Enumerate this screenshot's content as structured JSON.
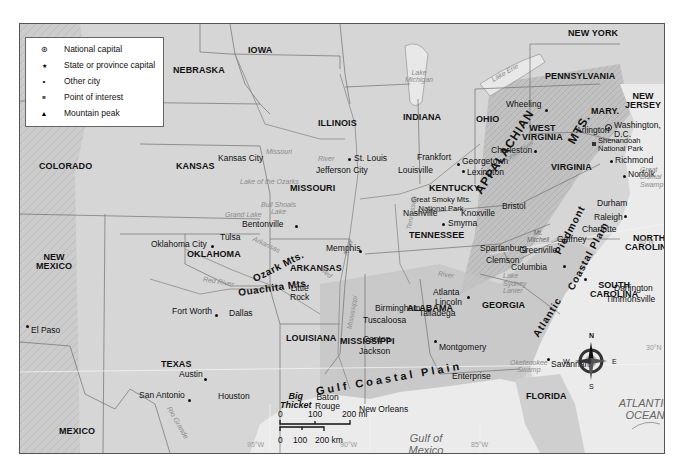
{
  "legend": {
    "items": [
      {
        "symbol": "national-capital-icon",
        "glyph": "⊛",
        "label": "National capital"
      },
      {
        "symbol": "state-capital-icon",
        "glyph": "★",
        "label": "State or province capital"
      },
      {
        "symbol": "city-icon",
        "glyph": "•",
        "label": "Other city"
      },
      {
        "symbol": "point-of-interest-icon",
        "glyph": "■",
        "label": "Point of interest"
      },
      {
        "symbol": "mountain-peak-icon",
        "glyph": "▲",
        "label": "Mountain peak"
      }
    ]
  },
  "states": {
    "nebraska": "NEBRASKA",
    "iowa": "IOWA",
    "illinois": "ILLINOIS",
    "indiana": "INDIANA",
    "ohio": "OHIO",
    "pennsylvania": "PENNSYLVANIA",
    "new_york": "NEW YORK",
    "new_jersey": "NEW\nJERSEY",
    "maryland": "MARY.",
    "west_virginia": "WEST\nVIRGINIA",
    "virginia": "VIRGINIA",
    "kentucky": "KENTUCKY",
    "tennessee": "TENNESSEE",
    "north_carolina": "NORTH\nCAROLINA",
    "south_carolina": "SOUTH\nCAROLINA",
    "georgia": "GEORGIA",
    "alabama": "ALABAMA",
    "mississippi": "MISSISSIPPI",
    "louisiana": "LOUISIANA",
    "arkansas": "ARKANSAS",
    "missouri": "MISSOURI",
    "kansas": "KANSAS",
    "colorado": "COLORADO",
    "oklahoma": "OKLAHOMA",
    "new_mexico": "NEW\nMEXICO",
    "texas": "TEXAS",
    "florida": "FLORIDA",
    "mexico": "MEXICO"
  },
  "cities": {
    "washington": "Washington,\nD.C.",
    "arlington": "Arlington",
    "richmond": "Richmond",
    "norfolk": "Norfolk",
    "wheeling": "Wheeling",
    "charleston": "Charleston",
    "frankfort": "Frankfort",
    "georgetown": "Georgetown",
    "lexington": "Lexington",
    "louisville": "Louisville",
    "bristol": "Bristol",
    "nashville": "Nashville",
    "knoxville": "Knoxville",
    "smyrna": "Smyrna",
    "durham": "Durham",
    "raleigh": "Raleigh",
    "charlotte": "Charlotte",
    "gaffney": "Gaffney",
    "spartanburg": "Spartanburg",
    "greenville": "Greenville",
    "clemson": "Clemson",
    "columbia": "Columbia",
    "darlington": "Darlington",
    "timmonsville": "Timmonsville",
    "savannah": "Savannah",
    "atlanta": "Atlanta",
    "lincoln": "Lincoln",
    "talladega": "Talladega",
    "birmingham": "Birmingham",
    "tuscaloosa": "Tuscaloosa",
    "montgomery": "Montgomery",
    "enterprise": "Enterprise",
    "canton": "Canton",
    "jackson": "Jackson",
    "memphis": "Memphis",
    "little_rock": "Little\nRock",
    "st_louis": "St. Louis",
    "jefferson_city": "Jefferson City",
    "kansas_city": "Kansas City",
    "bentonville": "Bentonville",
    "tulsa": "Tulsa",
    "oklahoma_city": "Oklahoma City",
    "fort_worth": "Fort Worth",
    "dallas": "Dallas",
    "austin": "Austin",
    "san_antonio": "San Antonio",
    "houston": "Houston",
    "baton_rouge": "Baton\nRouge",
    "new_orleans": "New Orleans",
    "el_paso": "El Paso"
  },
  "points_of_interest": {
    "shenandoah": "Shenandoah\nNational Park",
    "smoky": "Great Smoky Mts.\nNational Park",
    "mt_mitchell": "Mt.\nMitchell",
    "big_thicket": "Big\nThicket"
  },
  "physical": {
    "appalachian": "APPALACHIAN",
    "mts": "MTS.",
    "piedmont": "Piedmont",
    "atlantic_coastal_plain_1": "Atlantic",
    "atlantic_coastal_plain_2": "Coastal Plain",
    "gulf_coastal_plain": "Gulf Coastal Plain",
    "ozark": "Ozark Mts.",
    "ouachita": "Ouachita Mts."
  },
  "water": {
    "lake_michigan": "Lake\nMichigan",
    "lake_erie": "Lake Erie",
    "ohio_river": "Ohio River",
    "missouri_river_1": "Missouri",
    "missouri_river_2": "River",
    "lake_of_the_ozarks": "Lake of the Ozarks",
    "bull_shoals": "Bull Shoals\nLake",
    "grand_lake": "Grand Lake",
    "arkansas_river": "Arkansas",
    "red_river": "Red River",
    "red_river_2": "Red",
    "mississippi_river": "Mississippi",
    "river_ms": "River",
    "tennessee_river": "Tennessee",
    "tennessee_river_2": "River",
    "lake_sydney_lanier": "Lake\nSydney\nLanier",
    "okefenokee": "Okefenokee\nSwamp",
    "great_dismal": "Great\nDismal\nSwamp",
    "rio_grande": "Rio Grande",
    "atlantic": "ATLANTIC\nOCEAN",
    "gulf": "Gulf of\nMexico"
  },
  "graticule": {
    "lat35": "35°N",
    "lat30": "30°N",
    "lon95": "95°W",
    "lon90": "90°W",
    "lon85": "85°W"
  },
  "compass": {
    "n": "N",
    "s": "S",
    "e": "E",
    "w": "W"
  },
  "scale": {
    "mi_ticks": [
      "0",
      "100",
      "200 mi"
    ],
    "km_ticks": [
      "0",
      "100",
      "200 km"
    ]
  }
}
